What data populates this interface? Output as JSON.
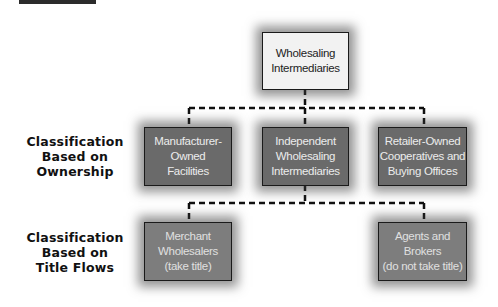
{
  "diagram": {
    "root": {
      "label": "Wholesaling\nIntermediaries"
    },
    "row_labels": [
      {
        "label": "Classification\nBased on\nOwnership"
      },
      {
        "label": "Classification\nBased on\nTitle Flows"
      }
    ],
    "ownership_nodes": [
      {
        "label": "Manufacturer-\nOwned\nFacilities"
      },
      {
        "label": "Independent\nWholesaling\nIntermediaries"
      },
      {
        "label": "Retailer-Owned\nCooperatives and\nBuying Offices"
      }
    ],
    "title_flow_nodes": [
      {
        "label": "Merchant\nWholesalers\n(take title)"
      },
      {
        "label": "Agents and\nBrokers\n(do not take title)"
      }
    ],
    "connections": [
      {
        "from": "Wholesaling Intermediaries",
        "to": "Manufacturer-Owned Facilities"
      },
      {
        "from": "Wholesaling Intermediaries",
        "to": "Independent Wholesaling Intermediaries"
      },
      {
        "from": "Wholesaling Intermediaries",
        "to": "Retailer-Owned Cooperatives and Buying Offices"
      },
      {
        "from": "Independent Wholesaling Intermediaries",
        "to": "Merchant Wholesalers (take title)"
      },
      {
        "from": "Independent Wholesaling Intermediaries",
        "to": "Agents and Brokers (do not take title)"
      }
    ]
  }
}
